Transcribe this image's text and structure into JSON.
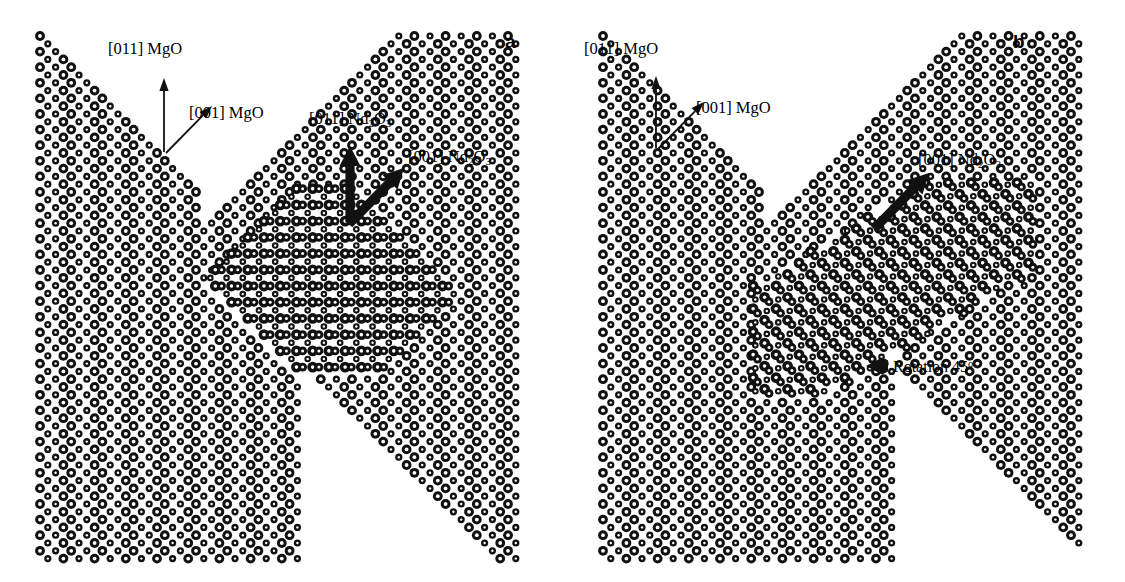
{
  "figure": {
    "width": 1125,
    "height": 582,
    "background": "#ffffff",
    "ink": "#111111"
  },
  "panels": [
    {
      "id": "a",
      "letter": "a",
      "letter_pos": {
        "x": 505,
        "y": 32
      },
      "substrate": "MgO",
      "island": "Nd2O3",
      "island_rotation_deg": 0,
      "labels": [
        {
          "name": "label-011-mgo",
          "text_main": "[011] MgO",
          "text_pre": "[011] MgO",
          "sub": "",
          "text_post": "",
          "x": 108,
          "y": 40
        },
        {
          "name": "label-001-mgo",
          "text_main": "[001] MgO",
          "text_pre": "[001] MgO",
          "sub": "",
          "text_post": "",
          "x": 189,
          "y": 104
        },
        {
          "name": "label-011-nd2o3",
          "text_main": "[011] Nd2O3",
          "text_pre": "[011] Nd",
          "sub": "2",
          "text_post": "O",
          "sub2": "3",
          "x": 309,
          "y": 110
        },
        {
          "name": "label-001-nd2o3",
          "text_main": "[001] Nd2O3",
          "text_pre": "[001] Nd",
          "sub": "2",
          "text_post": "O",
          "sub2": "3",
          "x": 408,
          "y": 148
        }
      ],
      "arrows": [
        {
          "name": "arrow-011-mgo",
          "x1": 164,
          "y1": 152,
          "x2": 164,
          "y2": 78,
          "style": "thin"
        },
        {
          "name": "arrow-001-mgo",
          "x1": 166,
          "y1": 153,
          "x2": 212,
          "y2": 106,
          "style": "thin"
        },
        {
          "name": "arrow-011-nd2o3",
          "x1": 350,
          "y1": 222,
          "x2": 350,
          "y2": 146,
          "style": "thick"
        },
        {
          "name": "arrow-001-nd2o3",
          "x1": 349,
          "y1": 224,
          "x2": 404,
          "y2": 168,
          "style": "thick"
        }
      ]
    },
    {
      "id": "b",
      "letter": "b",
      "letter_pos": {
        "x": 1013,
        "y": 32
      },
      "substrate": "MgO",
      "island": "Nd2O3",
      "island_rotation_deg": 45,
      "labels": [
        {
          "name": "label-011-mgo",
          "text_main": "[011] MgO",
          "text_pre": "[011] MgO",
          "sub": "",
          "text_post": "",
          "x": 584,
          "y": 40
        },
        {
          "name": "label-001-mgo",
          "text_main": "[001] MgO",
          "text_pre": "[001] MgO",
          "sub": "",
          "text_post": "",
          "x": 696,
          "y": 99
        },
        {
          "name": "label-001-nd2o3",
          "text_main": "[001] Nd2O3",
          "text_pre": "[001] Nd",
          "sub": "2",
          "text_post": "O",
          "sub2": "3",
          "x": 918,
          "y": 151
        }
      ],
      "arrows": [
        {
          "name": "arrow-011-mgo",
          "x1": 656,
          "y1": 148,
          "x2": 656,
          "y2": 76,
          "style": "thin"
        },
        {
          "name": "arrow-001-mgo",
          "x1": 658,
          "y1": 149,
          "x2": 704,
          "y2": 102,
          "style": "thin"
        },
        {
          "name": "arrow-001-nd2o3",
          "x1": 874,
          "y1": 229,
          "x2": 929,
          "y2": 173,
          "style": "thick"
        }
      ],
      "rotation_note": {
        "name": "rotation-note",
        "text_pre": "Rotation 45",
        "sup": "o",
        "text": "Rotation 45o",
        "x": 893,
        "y": 358,
        "arrow": {
          "x1": 888,
          "y1": 366,
          "x2": 866,
          "y2": 366,
          "style": "stub"
        }
      }
    }
  ],
  "lattice": {
    "note": "square lattice rotated 45 deg; rows step by half-period in x",
    "period": 15.6,
    "atom_large_r": 4.9,
    "atom_small_r": 3.6,
    "atom_hole_large_r": 1.9,
    "atom_hole_small_r": 1.2,
    "ring_stroke": 2.2,
    "island_large_r": 5.4,
    "island_small_r": 3.3
  },
  "legend_species": [
    {
      "name": "oxygen-atom",
      "label": "O",
      "render": "large-ring"
    },
    {
      "name": "metal-atom",
      "label": "Mg / Nd",
      "render": "small-ring"
    }
  ]
}
